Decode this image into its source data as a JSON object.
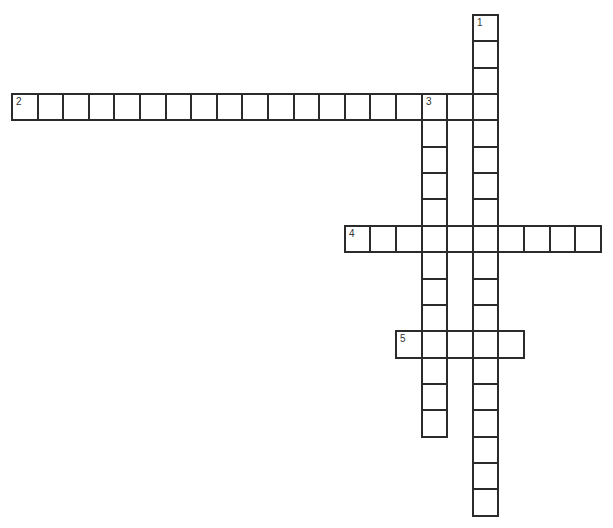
{
  "puzzle": {
    "type": "crossword",
    "grid": {
      "origin_x": 11,
      "origin_y": 14,
      "cell_w": 25.6,
      "cell_h": 26.35
    },
    "words": [
      {
        "number": "1",
        "direction": "down",
        "row": 0,
        "col": 18,
        "length": 19
      },
      {
        "number": "2",
        "direction": "across",
        "row": 3,
        "col": 0,
        "length": 19
      },
      {
        "number": "3",
        "direction": "down",
        "row": 3,
        "col": 16,
        "length": 13
      },
      {
        "number": "4",
        "direction": "across",
        "row": 8,
        "col": 13,
        "length": 10
      },
      {
        "number": "5",
        "direction": "across",
        "row": 12,
        "col": 15,
        "length": 5
      }
    ],
    "border_color": "#2b2b2b",
    "background_color": "#ffffff"
  }
}
